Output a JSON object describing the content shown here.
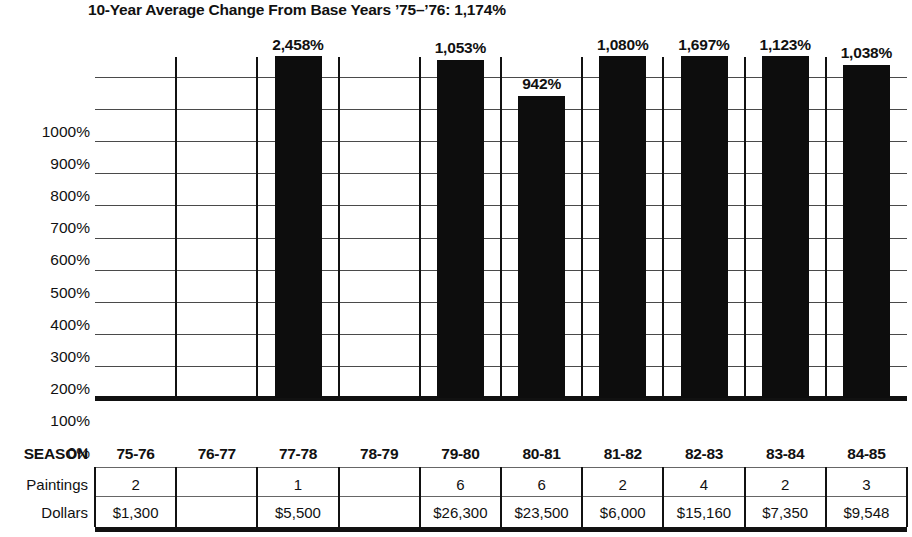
{
  "chart_data": {
    "type": "bar",
    "title": "10-Year Average Change From Base Years ’75–’76: 1,174%",
    "xlabel": "",
    "ylabel": "",
    "ylim": [
      0,
      1000
    ],
    "grid": true,
    "legend": "none",
    "categories": [
      "75-76",
      "76-77",
      "77-78",
      "78-79",
      "79-80",
      "80-81",
      "81-82",
      "82-83",
      "83-84",
      "84-85"
    ],
    "values": [
      null,
      null,
      2458,
      null,
      1053,
      942,
      1080,
      1697,
      1123,
      1038
    ],
    "value_labels": [
      "",
      "",
      "2,458%",
      "",
      "1,053%",
      "942%",
      "1,080%",
      "1,697%",
      "1,123%",
      "1,038%"
    ],
    "ytick_labels": [
      "1000%",
      "900%",
      "800%",
      "700%",
      "600%",
      "500%",
      "400%",
      "300%",
      "200%",
      "100%",
      "0%"
    ],
    "ytick_values": [
      1000,
      900,
      800,
      700,
      600,
      500,
      400,
      300,
      200,
      100,
      0
    ],
    "bar_color": "#0d0d0d",
    "grid_color": "#4a4a4a",
    "axis_color": "#111111",
    "table_rows": [
      {
        "label": "SEASON",
        "values": [
          "75-76",
          "76-77",
          "77-78",
          "78-79",
          "79-80",
          "80-81",
          "81-82",
          "82-83",
          "83-84",
          "84-85"
        ]
      },
      {
        "label": "Paintings",
        "values": [
          "2",
          "",
          "1",
          "",
          "6",
          "6",
          "2",
          "4",
          "2",
          "3"
        ]
      },
      {
        "label": "Dollars",
        "values": [
          "$1,300",
          "",
          "$5,500",
          "",
          "$26,300",
          "$23,500",
          "$6,000",
          "$15,160",
          "$7,350",
          "$9,548"
        ]
      }
    ]
  }
}
